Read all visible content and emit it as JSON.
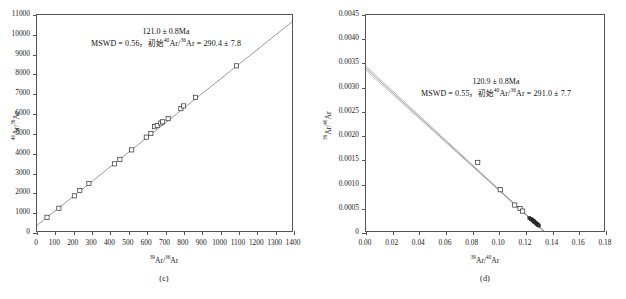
{
  "figure": {
    "title": "",
    "background_color": "#ffffff",
    "panel_count": 2
  },
  "panels": [
    {
      "id": "c",
      "caption": "(c)",
      "xlabel_pre": "",
      "xlabel": "39Ar/36Ar",
      "ylabel": "40Ar/36Ar",
      "annotation_line1": "121.0 ± 0.8Ma",
      "annotation_line2_prefix": "MSWD = 0.56，",
      "annotation_line2_cjk": "初始",
      "annotation_line2_suffix": "Ar/",
      "annotation_line2_tail": "Ar = 290.4 ± 7.8",
      "age": "121.0 ± 0.8Ma",
      "mswd": "0.56",
      "initial_ratio": "290.4 ± 7.8"
    },
    {
      "id": "d",
      "caption": "(d)",
      "xlabel": "39Ar/40Ar",
      "ylabel": "36Ar/40Ar",
      "annotation_line1": "120.9 ± 0.8Ma",
      "annotation_line2_prefix": "MSWD = 0.55，",
      "annotation_line2_cjk": "初始",
      "annotation_line2_suffix": "Ar/",
      "annotation_line2_tail": "Ar = 291.0 ± 7.7",
      "age": "120.9 ± 0.8Ma",
      "mswd": "0.55",
      "initial_ratio": "291.0 ± 7.7"
    }
  ],
  "chart_data": [
    {
      "type": "scatter",
      "panel": "c",
      "title": "121.0 ± 0.8Ma",
      "subtitle": "MSWD = 0.56，初始40Ar/36Ar = 290.4 ± 7.8",
      "xlabel": "39Ar/36Ar",
      "ylabel": "40Ar/36Ar",
      "xlim": [
        0,
        1400
      ],
      "ylim": [
        0,
        11000
      ],
      "xticks": [
        0,
        100,
        200,
        300,
        400,
        500,
        600,
        700,
        800,
        900,
        1000,
        1100,
        1200,
        1300,
        1400
      ],
      "yticks": [
        0,
        1000,
        2000,
        3000,
        4000,
        5000,
        6000,
        7000,
        8000,
        9000,
        10000,
        11000
      ],
      "xticklabels": [
        "0",
        "100",
        "200",
        "300",
        "400",
        "500",
        "600",
        "700",
        "800",
        "900",
        "1000",
        "1100",
        "1200",
        "1300",
        "1400"
      ],
      "yticklabels": [
        "0",
        "1000",
        "2000",
        "3000",
        "4000",
        "5000",
        "6000",
        "7000",
        "8000",
        "9000",
        "10000",
        "11000"
      ],
      "grid": false,
      "legend": "none",
      "fit_line": {
        "intercept": 290.4,
        "slope": 7.4,
        "x_start": 0,
        "x_end": 1400,
        "y_start": 290,
        "y_end": 10650
      },
      "points_x": [
        55,
        120,
        205,
        235,
        285,
        425,
        455,
        520,
        600,
        625,
        645,
        660,
        680,
        690,
        720,
        790,
        805,
        870,
        1095
      ],
      "points_y": [
        700,
        1160,
        1790,
        2060,
        2420,
        3420,
        3650,
        4130,
        4780,
        4960,
        5310,
        5370,
        5500,
        5560,
        5720,
        6230,
        6370,
        6810,
        8410
      ],
      "n_points": 19
    },
    {
      "type": "scatter",
      "panel": "d",
      "title": "120.9 ± 0.8Ma",
      "subtitle": "MSWD = 0.55，初始40Ar/36Ar = 291.0 ± 7.7",
      "xlabel": "39Ar/40Ar",
      "ylabel": "36Ar/40Ar",
      "xlim": [
        0,
        0.18
      ],
      "ylim": [
        0,
        0.0045
      ],
      "xticks": [
        0.0,
        0.02,
        0.04,
        0.06,
        0.08,
        0.1,
        0.12,
        0.14,
        0.16,
        0.18
      ],
      "yticks": [
        0,
        0.0005,
        0.001,
        0.0015,
        0.002,
        0.0025,
        0.003,
        0.0035,
        0.004,
        0.0045
      ],
      "xticklabels": [
        "0.00",
        "0.02",
        "0.04",
        "0.06",
        "0.08",
        "0.10",
        "0.12",
        "0.14",
        "0.16",
        "0.18"
      ],
      "yticklabels": [
        "0",
        "0.0005",
        "0.0010",
        "0.0015",
        "0.0020",
        "0.0025",
        "0.0030",
        "0.0035",
        "0.0040",
        "0.0045"
      ],
      "grid": false,
      "legend": "none",
      "fit_line": {
        "y_intercept": 0.003436,
        "x_intercept": 0.1345,
        "envelope_lower_intercept": 0.003345,
        "envelope_upper_intercept": 0.003436
      },
      "points_x": [
        0.0845,
        0.1015,
        0.1125,
        0.1165,
        0.1185,
        0.1235,
        0.1245,
        0.1252,
        0.1258,
        0.1262,
        0.1268,
        0.1272,
        0.1278,
        0.1282,
        0.1288,
        0.1292,
        0.1298,
        0.1302,
        0.1308
      ],
      "points_y": [
        0.00143,
        0.00086,
        0.00054,
        0.00047,
        0.000415,
        0.00027,
        0.000255,
        0.00024,
        0.000228,
        0.000218,
        0.000205,
        0.000195,
        0.000182,
        0.000172,
        0.000158,
        0.000148,
        0.000135,
        0.000125,
        0.000112
      ],
      "n_points": 19
    }
  ],
  "colors": {
    "axis": "#555555",
    "text": "#1a1a1a",
    "fit_line": "#6e6e6e",
    "envelope": "#9a9a9a",
    "marker_fill": "#ffffff",
    "marker_edge": "#2b2b2b",
    "background": "#ffffff"
  }
}
